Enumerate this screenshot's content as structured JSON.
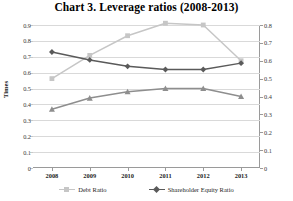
{
  "chart_data": {
    "type": "line",
    "title": "Chart 3.  Leverage ratios (2008-2013)",
    "categories": [
      "2008",
      "2009",
      "2010",
      "2011",
      "2012",
      "2013"
    ],
    "x": [
      2008,
      2009,
      2010,
      2011,
      2012,
      2013
    ],
    "xlabel": "",
    "ylabel": "Times",
    "y2label": "Percentage (%)",
    "ylim": [
      0,
      0.9
    ],
    "y2lim": [
      0,
      0.8
    ],
    "ytick_labels_left": [
      "0.9",
      "0.8",
      "0.7",
      "0.6",
      "0.5",
      "0.4",
      "0.3",
      "0.2",
      "0.1",
      "0"
    ],
    "ytick_values_left": [
      0.9,
      0.8,
      0.7,
      0.6,
      0.5,
      0.4,
      0.3,
      0.2,
      0.1,
      0
    ],
    "ytick_labels_right": [
      "0.8",
      "0.7",
      "0.6",
      "0.5",
      "0.4",
      "0.3",
      "0.2",
      "0.1",
      "0"
    ],
    "ytick_values_right": [
      0.8,
      0.7,
      0.6,
      0.5,
      0.4,
      0.3,
      0.2,
      0.1,
      0
    ],
    "grid": true,
    "legend_position": "bottom",
    "series": [
      {
        "name": "Debt Ratio",
        "color": "#c6c6c6",
        "marker": "square",
        "axis": "right",
        "values": [
          0.5,
          0.63,
          0.74,
          0.81,
          0.8,
          0.6
        ]
      },
      {
        "name": "Shareholder Equity Ratio",
        "color": "#5a5a5a",
        "marker": "diamond",
        "axis": "left",
        "values": [
          0.73,
          0.68,
          0.64,
          0.62,
          0.62,
          0.66
        ]
      },
      {
        "name": "Third Ratio",
        "color": "#8e8e8e",
        "marker": "triangle",
        "axis": "left",
        "values": [
          0.37,
          0.44,
          0.48,
          0.5,
          0.5,
          0.45
        ]
      }
    ]
  },
  "legend": {
    "items": [
      {
        "label": "Debt Ratio"
      },
      {
        "label": "Shareholder Equity Ratio"
      }
    ]
  },
  "colors": {
    "grid": "#d9d9d9",
    "axis": "#9a9a9a",
    "text": "#1d1d1d",
    "debt_ratio": "#c6c6c6",
    "shareholder_equity_ratio": "#5a5a5a",
    "third_series": "#8e8e8e"
  }
}
